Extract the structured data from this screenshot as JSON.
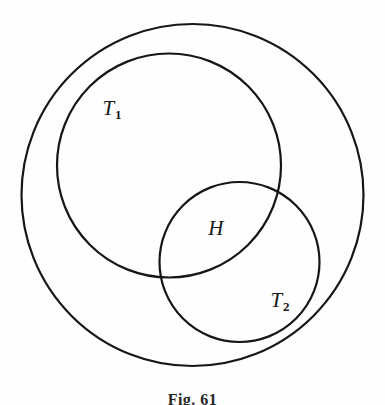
{
  "figure": {
    "caption": "Fig. 61",
    "background_color": "#fefefe",
    "stroke_color": "#161616",
    "labels": {
      "t1_base": "T",
      "t1_sub": "1",
      "h": "H",
      "t2_base": "T",
      "t2_sub": "2"
    }
  },
  "chart_data": {
    "type": "diagram",
    "diagram_type": "venn",
    "title": "Fig. 61",
    "units": "pixels",
    "canvas": {
      "width": 385,
      "height": 405
    },
    "sets": [
      {
        "name": "outer",
        "label": "",
        "cx": 192.5,
        "cy": 195,
        "r": 171,
        "stroke_width": 2.2,
        "bounds": {
          "left": 23,
          "right": 362,
          "top": 22,
          "bottom": 368
        }
      },
      {
        "name": "T1",
        "label": "T1",
        "cx": 169,
        "cy": 165.5,
        "r": 112,
        "stroke_width": 2.2,
        "bounds": {
          "left": 57,
          "right": 281,
          "top": 53,
          "bottom": 278
        }
      },
      {
        "name": "T2",
        "label": "T2",
        "cx": 239.5,
        "cy": 262,
        "r": 80,
        "stroke_width": 2.2,
        "bounds": {
          "left": 160,
          "right": 319,
          "top": 181,
          "bottom": 343
        }
      }
    ],
    "regions": [
      {
        "name": "T1",
        "label": "T1",
        "x": 112,
        "y": 109
      },
      {
        "name": "H",
        "label": "H",
        "x": 216,
        "y": 228,
        "note": "intersection of T1 and T2"
      },
      {
        "name": "T2",
        "label": "T2",
        "x": 280,
        "y": 301
      }
    ],
    "intersections": [
      {
        "between": [
          "T1",
          "T2"
        ],
        "x": 283,
        "y": 191
      },
      {
        "between": [
          "T1",
          "T2"
        ],
        "x": 166,
        "y": 273
      }
    ],
    "containment": [
      {
        "inner": "T1",
        "outer": "outer"
      },
      {
        "inner": "T2",
        "outer": "outer"
      }
    ]
  }
}
